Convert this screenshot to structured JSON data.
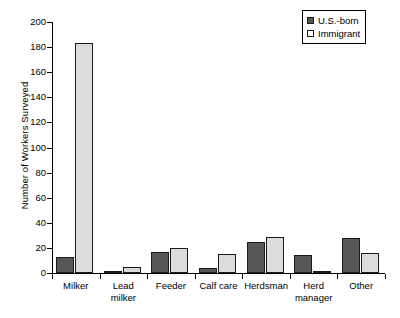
{
  "chart_data": {
    "type": "bar",
    "title": "",
    "xlabel": "",
    "ylabel": "Number of Workers Surveyed",
    "ylim": [
      0,
      200
    ],
    "ytick_step": 20,
    "yticks": [
      0,
      20,
      40,
      60,
      80,
      100,
      120,
      140,
      160,
      180,
      200
    ],
    "grid": false,
    "legend_position": "top-right",
    "categories": [
      "Milker",
      "Lead milker",
      "Feeder",
      "Calf care",
      "Herdsman",
      "Herd manager",
      "Other"
    ],
    "series": [
      {
        "name": "U.S.-born",
        "color": "#575757",
        "values": [
          13,
          1,
          17,
          4,
          25,
          14,
          28
        ]
      },
      {
        "name": "Immigrant",
        "color": "#dcdcdc",
        "values": [
          183,
          5,
          20,
          15,
          29,
          2,
          16
        ]
      }
    ]
  },
  "legend": {
    "items": [
      {
        "label": "U.S.-born"
      },
      {
        "label": "Immigrant"
      }
    ]
  }
}
